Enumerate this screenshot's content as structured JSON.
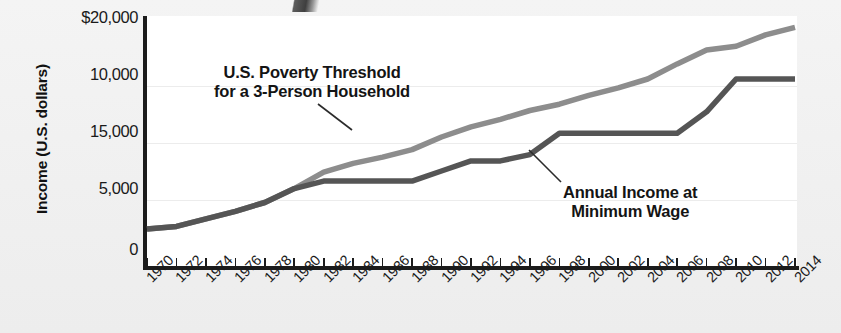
{
  "chart_data": {
    "type": "line",
    "title": "",
    "subtitle": "",
    "xlabel": "",
    "ylabel": "Income (U.S. dollars)",
    "grid": true,
    "legend_position": "inline-annotations",
    "axis_note": "Y-axis tick labels appear in the printed order $20,000 / 10,000 / 15,000 / 5,000 / 0 from top to bottom as rendered in the source image.",
    "ytick_labels": [
      "$20,000",
      "10,000",
      "15,000",
      "5,000",
      "0"
    ],
    "ytick_values": [
      20000,
      15000,
      10000,
      5000,
      0
    ],
    "ylim": [
      0,
      20000
    ],
    "xlim": [
      1970,
      2014
    ],
    "categories": [
      1970,
      1972,
      1974,
      1976,
      1978,
      1980,
      1982,
      1984,
      1986,
      1988,
      1990,
      1992,
      1994,
      1996,
      1998,
      2000,
      2002,
      2004,
      2006,
      2008,
      2010,
      2012,
      2014
    ],
    "xtick_labels": [
      "1970",
      "1972",
      "1974",
      "1976",
      "1978",
      "1980",
      "1982",
      "1984",
      "1986",
      "1988",
      "1990",
      "1992",
      "1994",
      "1996",
      "1998",
      "2000",
      "2002",
      "2004",
      "2006",
      "2008",
      "2010",
      "2012",
      "2014"
    ],
    "series": [
      {
        "name": "U.S. Poverty Threshold for a 3-Person Household",
        "color": "#8d8d8d",
        "annotation_lines": [
          "U.S. Poverty Threshold",
          "for a 3-Person Household"
        ],
        "values": [
          3100,
          3300,
          3900,
          4500,
          5200,
          6300,
          7600,
          8300,
          8800,
          9400,
          10400,
          11200,
          11800,
          12500,
          13000,
          13700,
          14300,
          15000,
          16200,
          17300,
          17600,
          18500,
          19100
        ]
      },
      {
        "name": "Annual Income at Minimum Wage",
        "color": "#555555",
        "annotation_lines": [
          "Annual Income at",
          "Minimum Wage"
        ],
        "values": [
          3100,
          3300,
          3900,
          4500,
          5200,
          6300,
          6900,
          6900,
          6900,
          6900,
          7700,
          8500,
          8500,
          9000,
          10700,
          10700,
          10700,
          10700,
          10700,
          12400,
          15000,
          15000,
          15000
        ]
      }
    ],
    "annotations": [
      {
        "name": "poverty-threshold-label",
        "text": "U.S. Poverty Threshold for a 3-Person Household"
      },
      {
        "name": "minimum-wage-label",
        "text": "Annual Income at Minimum Wage"
      }
    ]
  },
  "figure": {
    "y_axis_title": "Income (U.S. dollars)",
    "annotation_poverty_line1": "U.S. Poverty Threshold",
    "annotation_poverty_line2": "for a 3-Person Household",
    "annotation_minwage_line1": "Annual Income at",
    "annotation_minwage_line2": "Minimum Wage"
  }
}
